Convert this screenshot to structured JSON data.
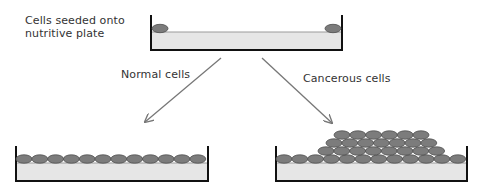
{
  "labels": {
    "seeded_line1": "Cells seeded onto",
    "seeded_line2": "nutritive plate",
    "normal": "Normal cells",
    "cancerous": "Cancerous cells"
  },
  "colors": {
    "cell_fill": "#7c7c7c",
    "cell_stroke": "#4f4f4f",
    "medium_fill": "#e6e6e6",
    "medium_line": "#9a9a9a",
    "wall": "#111111",
    "arrow": "#777777",
    "text": "#333333"
  },
  "plates": {
    "seed": {
      "x1": 151,
      "x2": 342,
      "top": 15,
      "bottom": 50,
      "medium_top": 32
    },
    "normal": {
      "x1": 16,
      "x2": 208,
      "top": 146,
      "bottom": 181,
      "medium_top": 163
    },
    "cancerous": {
      "x1": 276,
      "x2": 467,
      "top": 146,
      "bottom": 181,
      "medium_top": 163
    }
  },
  "cell_rows": {
    "seed": [
      {
        "y": 28.5,
        "xs": [
          160,
          333
        ]
      }
    ],
    "normal": [
      {
        "y": 159,
        "start": 24,
        "count": 12,
        "step": 15.8
      }
    ],
    "cancerous": [
      {
        "y": 159,
        "start": 284,
        "count": 12,
        "step": 15.8
      },
      {
        "y": 151,
        "start": 326,
        "count": 8,
        "step": 15.8
      },
      {
        "y": 143,
        "start": 334,
        "count": 7,
        "step": 15.8
      },
      {
        "y": 135,
        "start": 342,
        "count": 6,
        "step": 15.8
      }
    ]
  },
  "arrows": [
    {
      "name": "arrow-to-normal",
      "x1": 221,
      "y1": 58,
      "x2": 145,
      "y2": 122
    },
    {
      "name": "arrow-to-cancerous",
      "x1": 262,
      "y1": 58,
      "x2": 332,
      "y2": 123
    }
  ]
}
